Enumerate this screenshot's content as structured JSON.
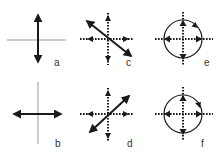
{
  "figure": {
    "panels": [
      {
        "id": "a",
        "label": "a",
        "kind": "axes-vertical-arrow",
        "description": "solid vertical double arrow on thin axes"
      },
      {
        "id": "b",
        "label": "b",
        "kind": "axes-horizontal-arrow",
        "description": "solid horizontal double arrow on thin axes"
      },
      {
        "id": "c",
        "label": "c",
        "kind": "dotted-axes-diagonal",
        "diagonal": "upper-left to lower-right"
      },
      {
        "id": "d",
        "label": "d",
        "kind": "dotted-axes-diagonal",
        "diagonal": "lower-left to upper-right"
      },
      {
        "id": "e",
        "label": "e",
        "kind": "dotted-axes-circle",
        "rotation": "clockwise"
      },
      {
        "id": "f",
        "label": "f",
        "kind": "dotted-axes-circle",
        "rotation": "clockwise"
      }
    ],
    "colors": {
      "ink": "#1a1a1a",
      "axis": "#999999",
      "label": "#333333"
    }
  }
}
